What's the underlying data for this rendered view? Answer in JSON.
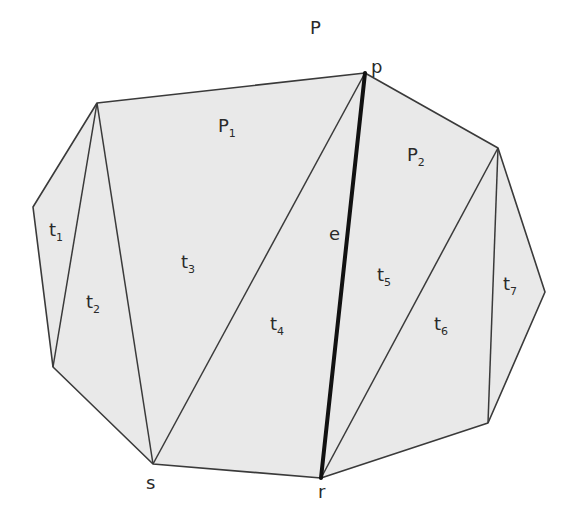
{
  "diagram": {
    "type": "polygon-triangulation",
    "colors": {
      "background": "#ffffff",
      "fill": "#e9e9e9",
      "stroke": "#3a3a3a",
      "highlight_edge": "#111111",
      "text": "#2a2a2a"
    },
    "vertices": {
      "A": [
        97,
        103
      ],
      "B": [
        33,
        207
      ],
      "C": [
        53,
        367
      ],
      "s": [
        153,
        464
      ],
      "r": [
        321,
        478
      ],
      "D": [
        488,
        423
      ],
      "E": [
        545,
        292
      ],
      "F": [
        498,
        148
      ],
      "p": [
        365,
        73
      ]
    },
    "polygon_order": [
      "A",
      "B",
      "C",
      "s",
      "r",
      "D",
      "E",
      "F",
      "p"
    ],
    "diagonals": [
      [
        "A",
        "C"
      ],
      [
        "A",
        "s"
      ],
      [
        "s",
        "p"
      ],
      [
        "r",
        "F"
      ],
      [
        "D",
        "F"
      ]
    ],
    "highlight_edge": [
      "p",
      "r"
    ],
    "labels": {
      "P": {
        "text": "P",
        "sub": "",
        "x": 310,
        "y": 34
      },
      "p": {
        "text": "p",
        "sub": "",
        "x": 371,
        "y": 73
      },
      "P1": {
        "text": "P",
        "sub": "1",
        "x": 218,
        "y": 132
      },
      "P2": {
        "text": "P",
        "sub": "2",
        "x": 407,
        "y": 161
      },
      "e": {
        "text": "e",
        "sub": "",
        "x": 329,
        "y": 240
      },
      "s": {
        "text": "s",
        "sub": "",
        "x": 146,
        "y": 489
      },
      "r": {
        "text": "r",
        "sub": "",
        "x": 318,
        "y": 498
      },
      "t1": {
        "text": "t",
        "sub": "1",
        "x": 49,
        "y": 236
      },
      "t2": {
        "text": "t",
        "sub": "2",
        "x": 86,
        "y": 308
      },
      "t3": {
        "text": "t",
        "sub": "3",
        "x": 181,
        "y": 268
      },
      "t4": {
        "text": "t",
        "sub": "4",
        "x": 270,
        "y": 330
      },
      "t5": {
        "text": "t",
        "sub": "5",
        "x": 377,
        "y": 281
      },
      "t6": {
        "text": "t",
        "sub": "6",
        "x": 434,
        "y": 330
      },
      "t7": {
        "text": "t",
        "sub": "7",
        "x": 503,
        "y": 290
      }
    }
  }
}
